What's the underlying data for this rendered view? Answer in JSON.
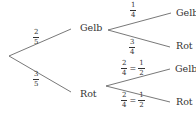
{
  "diagram": {
    "type": "probability-tree",
    "root": {
      "children": [
        {
          "label": "Gelb",
          "probability": {
            "num": "2",
            "den": "5"
          },
          "children": [
            {
              "label": "Gelb",
              "probability": {
                "num": "1",
                "den": "4"
              }
            },
            {
              "label": "Rot",
              "probability": {
                "num": "3",
                "den": "4"
              }
            }
          ]
        },
        {
          "label": "Rot",
          "probability": {
            "num": "3",
            "den": "5"
          },
          "children": [
            {
              "label": "Gelb",
              "probability": {
                "num": "2",
                "den": "4",
                "simplified_num": "1",
                "simplified_den": "2",
                "equals": "="
              }
            },
            {
              "label": "Rot",
              "probability": {
                "num": "2",
                "den": "4",
                "simplified_num": "1",
                "simplified_den": "2",
                "equals": "="
              }
            }
          ]
        }
      ]
    },
    "colors": {
      "line": "#555555",
      "text": "#333333"
    }
  }
}
